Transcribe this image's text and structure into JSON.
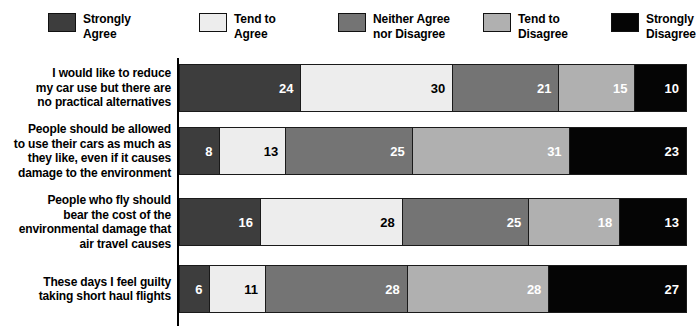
{
  "chart_data": {
    "type": "bar",
    "orientation": "horizontal",
    "stacked": true,
    "stack_unit": "percent",
    "title": "",
    "xlabel": "",
    "ylabel": "",
    "xlim": [
      0,
      100
    ],
    "grid": false,
    "legend_position": "top",
    "categories": [
      "I would like to reduce\nmy car use but there are\nno practical alternatives",
      "People should be allowed\nto use their cars as much as\nthey like, even if it causes\ndamage to the environment",
      "People who fly should\nbear the cost of the\nenvironmental damage that\nair travel causes",
      "These days I feel guilty\ntaking short haul flights"
    ],
    "series": [
      {
        "name": "Strongly\nAgree",
        "color": "#3d3d3d",
        "text_color": "#ffffff",
        "values": [
          24,
          8,
          16,
          6
        ]
      },
      {
        "name": "Tend to\nAgree",
        "color": "#ededed",
        "text_color": "#000000",
        "values": [
          30,
          13,
          28,
          11
        ]
      },
      {
        "name": "Neither Agree\nnor Disagree",
        "color": "#747474",
        "text_color": "#ffffff",
        "values": [
          21,
          25,
          25,
          28
        ]
      },
      {
        "name": "Tend to\nDisagree",
        "color": "#b0b0b0",
        "text_color": "#ffffff",
        "values": [
          15,
          31,
          18,
          28
        ]
      },
      {
        "name": "Strongly\nDisagree",
        "color": "#050505",
        "text_color": "#ffffff",
        "values": [
          10,
          23,
          13,
          27
        ]
      }
    ]
  },
  "legend": {
    "items": [
      {
        "label": "Strongly\nAgree",
        "color": "#3d3d3d"
      },
      {
        "label": "Tend to\nAgree",
        "color": "#ededed"
      },
      {
        "label": "Neither Agree\nnor Disagree",
        "color": "#747474"
      },
      {
        "label": "Tend to\nDisagree",
        "color": "#b0b0b0"
      },
      {
        "label": "Strongly\nDisagree",
        "color": "#050505"
      }
    ]
  },
  "layout": {
    "legend_x": [
      48,
      199,
      338,
      483,
      611
    ],
    "row_tops": [
      8,
      70,
      141,
      208
    ],
    "bar_tops": [
      8,
      71,
      142,
      209
    ],
    "bar_heights": [
      48,
      48,
      48,
      48
    ],
    "axis_color": "#000000",
    "background": "#ffffff"
  }
}
